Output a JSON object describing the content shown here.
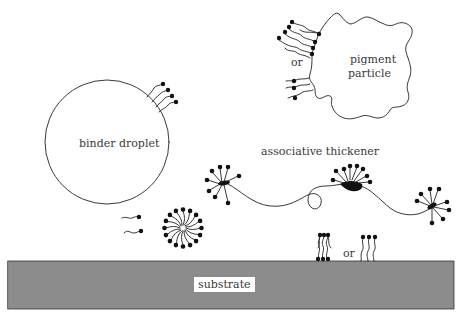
{
  "diagram": {
    "type": "schematic",
    "colors": {
      "background": "#ffffff",
      "ink": "#222222",
      "substrate_fill": "#8c8c8c",
      "substrate_label_bg": "#ffffff"
    },
    "labels": {
      "pigment_line1": "pigment",
      "pigment_line2": "particle",
      "pigment_or": "or",
      "binder": "binder droplet",
      "thickener": "associative thickener",
      "substrate": "substrate",
      "substrate_or": "or"
    },
    "elements": [
      {
        "id": "pigment-particle",
        "shape": "irregular blob",
        "label": "pigment particle",
        "attached": "surfactant tails (two alternatives separated by 'or')"
      },
      {
        "id": "binder-droplet",
        "shape": "circle",
        "label": "binder droplet",
        "attached": "4 surfactant molecules"
      },
      {
        "id": "associative-thickener",
        "shape": "polymer chain with 3 hydrophobic ends",
        "label": "associative thickener"
      },
      {
        "id": "free-surfactants",
        "shape": "2 single molecules"
      },
      {
        "id": "micelle",
        "shape": "spherical micelle"
      },
      {
        "id": "substrate",
        "shape": "gray slab",
        "label": "substrate",
        "attached": "adsorbed surfactants (two alternatives separated by 'or')"
      }
    ]
  }
}
